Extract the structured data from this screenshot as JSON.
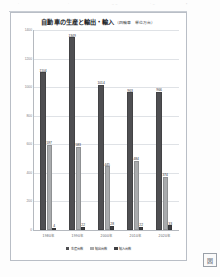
{
  "page": {
    "top_artifacts": [
      "·",
      "·",
      "– –",
      "· –",
      "▪"
    ],
    "stamp_label": "図"
  },
  "chart_data": {
    "type": "bar",
    "title": "自動車の生産と輸出・輸入",
    "title_unit": "（四輪車　単位万台）",
    "xlabel": "",
    "ylabel": "",
    "ylim": [
      0,
      1400
    ],
    "yticks": [
      0,
      200,
      400,
      600,
      800,
      1000,
      1200,
      1400
    ],
    "ytick_labels": [
      "0",
      "200",
      "400",
      "600",
      "800",
      "1000",
      "1200",
      "1400"
    ],
    "grid": true,
    "legend_position": "bottom",
    "categories": [
      "1980年",
      "1990年",
      "2000年",
      "2010年",
      "2020年"
    ],
    "series": [
      {
        "name": "生産台数",
        "color": "#4f4f52",
        "values": [
          1104,
          1349,
          1014,
          963,
          966
        ]
      },
      {
        "name": "輸出台数",
        "color": "#a9abad",
        "values": [
          597,
          583,
          445,
          484,
          374
        ]
      },
      {
        "name": "輸入台数",
        "color": "#3f4043",
        "values": [
          4,
          22,
          28,
          22,
          33
        ]
      }
    ]
  }
}
